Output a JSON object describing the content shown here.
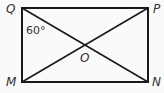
{
  "diagram": {
    "type": "rectangle-with-diagonals",
    "vertices": {
      "Q": {
        "label": "Q",
        "position": "top-left"
      },
      "P": {
        "label": "P",
        "position": "top-right"
      },
      "M": {
        "label": "M",
        "position": "bottom-left"
      },
      "N": {
        "label": "N",
        "position": "bottom-right"
      }
    },
    "center": {
      "label": "O"
    },
    "angle": {
      "label": "60°",
      "at": "Q",
      "between": [
        "QM",
        "QN"
      ]
    },
    "segments": [
      "QP",
      "PN",
      "NM",
      "MQ",
      "QN",
      "MP"
    ],
    "colors": {
      "line": "#1a1a1a",
      "background": "#fafafa",
      "text": "#333333"
    }
  }
}
